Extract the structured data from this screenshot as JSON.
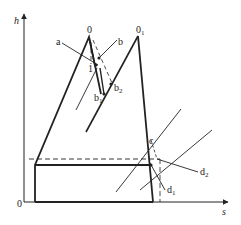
{
  "diagram": {
    "type": "h-s diagram",
    "axes": {
      "y_label": "h",
      "x_label": "s",
      "origin_label": "0"
    },
    "points": {
      "zero": "0",
      "zero_sub1": "0",
      "zero_sub1_index": "1",
      "one": "1",
      "a": "a",
      "b": "b",
      "b1": "b",
      "b1_index": "1",
      "b2": "b",
      "b2_index": "2",
      "c": "c",
      "d1": "d",
      "d1_index": "1",
      "d2": "d",
      "d2_index": "2"
    },
    "colors": {
      "stroke": "#222222",
      "background": "#ffffff"
    }
  }
}
